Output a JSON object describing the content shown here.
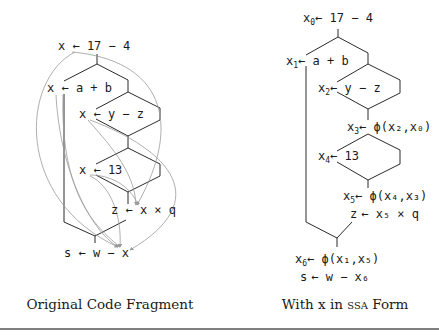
{
  "figure": {
    "left_panel": {
      "caption": "Original Code Fragment",
      "statements": [
        {
          "id": "s1",
          "text": "x ← 17 − 4"
        },
        {
          "id": "s2",
          "text": "x ← a + b"
        },
        {
          "id": "s3",
          "text": "x ← y − z"
        },
        {
          "id": "s4",
          "text": "x ← 13"
        },
        {
          "id": "s5",
          "text": "z ← x × q"
        },
        {
          "id": "s6",
          "text": "s ← w − x"
        }
      ]
    },
    "right_panel": {
      "caption_prefix": "With x in ",
      "caption_smallcaps": "SSA",
      "caption_suffix": " Form",
      "statements": [
        {
          "id": "r1",
          "lhs": "x",
          "lhs_sub": "0",
          "rhs": "← 17 − 4"
        },
        {
          "id": "r2",
          "lhs": "x",
          "lhs_sub": "1",
          "rhs": "← a + b"
        },
        {
          "id": "r3",
          "lhs": "x",
          "lhs_sub": "2",
          "rhs": "← y − z"
        },
        {
          "id": "r4",
          "lhs": "x",
          "lhs_sub": "3",
          "rhs": "← ϕ(x₂,x₀)"
        },
        {
          "id": "r5",
          "lhs": "x",
          "lhs_sub": "4",
          "rhs": "← 13"
        },
        {
          "id": "r6",
          "lhs": "x",
          "lhs_sub": "5",
          "rhs": "← ϕ(x₄,x₃)"
        },
        {
          "id": "r7",
          "lhs": "z",
          "lhs_sub": "",
          "rhs": "← x₅ × q"
        },
        {
          "id": "r8",
          "lhs": "x",
          "lhs_sub": "6",
          "rhs": "← ϕ(x₁,x₅)"
        },
        {
          "id": "r9",
          "lhs": "s",
          "lhs_sub": "",
          "rhs": "← w − x₆"
        }
      ]
    }
  }
}
